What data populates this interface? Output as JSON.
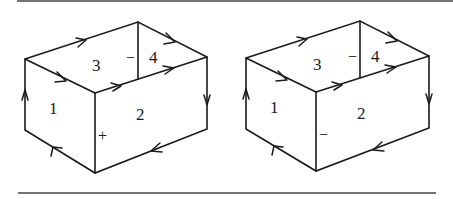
{
  "figures": [
    {
      "id": "left",
      "face_labels": {
        "face1": "1",
        "face2": "2",
        "face3": "3",
        "face4": "4"
      },
      "edge_signs": {
        "inner_back_edge": "−",
        "front_vertical_edge": "+"
      }
    },
    {
      "id": "right",
      "face_labels": {
        "face1": "1",
        "face2": "2",
        "face3": "3",
        "face4": "4"
      },
      "edge_signs": {
        "inner_back_edge": "−",
        "front_vertical_edge": "−"
      }
    }
  ],
  "colors": {
    "line": "#1a1a1a",
    "rule": "#444444",
    "background": "#ffffff"
  }
}
